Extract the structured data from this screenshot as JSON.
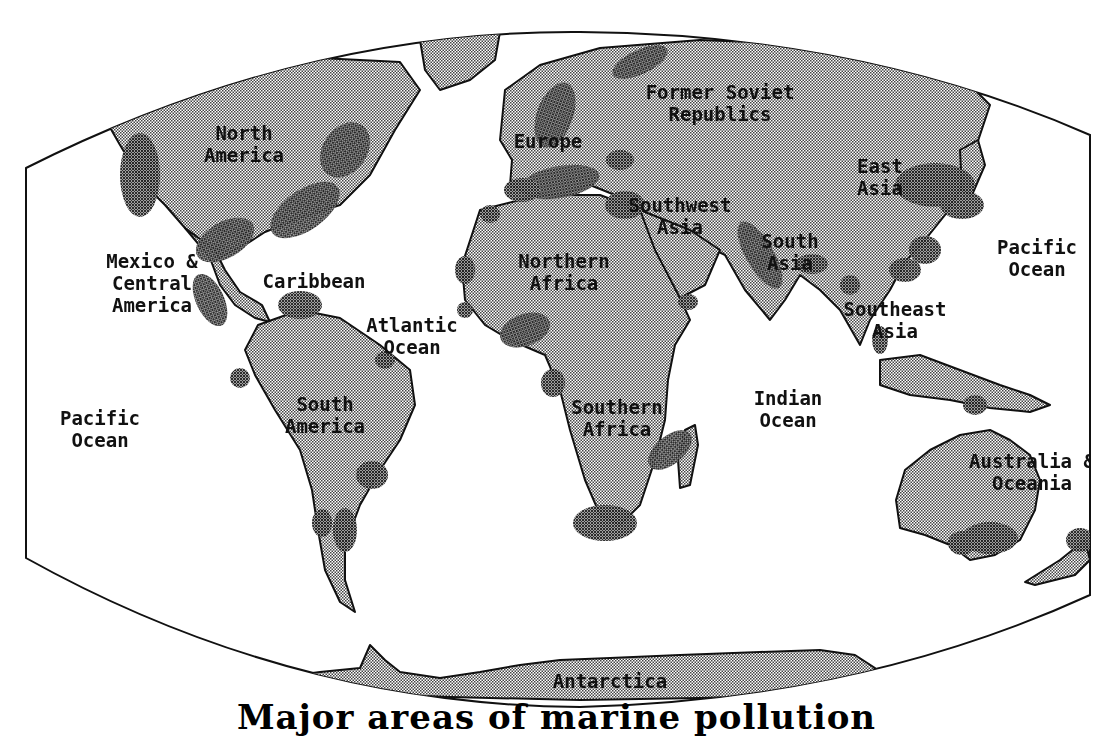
{
  "map": {
    "caption": "Major areas of marine pollution",
    "colors": {
      "land": "#c8c8c8",
      "pollution": "#555555",
      "ocean": "#ffffff",
      "outline": "#111111"
    },
    "regions": [
      {
        "id": "arctic",
        "label": [
          "Arctic"
        ],
        "x": 580,
        "y": 25
      },
      {
        "id": "north-america",
        "label": [
          "North",
          "America"
        ],
        "x": 244,
        "y": 140
      },
      {
        "id": "former-soviet",
        "label": [
          "Former Soviet",
          "Republics"
        ],
        "x": 720,
        "y": 99
      },
      {
        "id": "europe",
        "label": [
          "Europe"
        ],
        "x": 548,
        "y": 148
      },
      {
        "id": "east-asia",
        "label": [
          "East",
          "Asia"
        ],
        "x": 880,
        "y": 173
      },
      {
        "id": "southwest-asia",
        "label": [
          "Southwest",
          "Asia"
        ],
        "x": 680,
        "y": 212
      },
      {
        "id": "south-asia",
        "label": [
          "South",
          "Asia"
        ],
        "x": 790,
        "y": 248
      },
      {
        "id": "pacific-east",
        "label": [
          "Pacific",
          "Ocean"
        ],
        "x": 1037,
        "y": 254
      },
      {
        "id": "mexico-central",
        "label": [
          "Mexico &",
          "Central",
          "America"
        ],
        "x": 152,
        "y": 268
      },
      {
        "id": "caribbean",
        "label": [
          "Caribbean"
        ],
        "x": 314,
        "y": 288
      },
      {
        "id": "northern-africa",
        "label": [
          "Northern",
          "Africa"
        ],
        "x": 564,
        "y": 268
      },
      {
        "id": "atlantic",
        "label": [
          "Atlantic",
          "Ocean"
        ],
        "x": 412,
        "y": 332
      },
      {
        "id": "southeast-asia",
        "label": [
          "Southeast",
          "Asia"
        ],
        "x": 895,
        "y": 316
      },
      {
        "id": "pacific-west",
        "label": [
          "Pacific",
          "Ocean"
        ],
        "x": 100,
        "y": 425
      },
      {
        "id": "south-america",
        "label": [
          "South",
          "America"
        ],
        "x": 325,
        "y": 411
      },
      {
        "id": "southern-africa",
        "label": [
          "Southern",
          "Africa"
        ],
        "x": 617,
        "y": 414
      },
      {
        "id": "indian",
        "label": [
          "Indian",
          "Ocean"
        ],
        "x": 788,
        "y": 405
      },
      {
        "id": "australia",
        "label": [
          "Australia &",
          "Oceania"
        ],
        "x": 1032,
        "y": 468
      },
      {
        "id": "antarctica",
        "label": [
          "Antarctica"
        ],
        "x": 610,
        "y": 688
      }
    ]
  }
}
